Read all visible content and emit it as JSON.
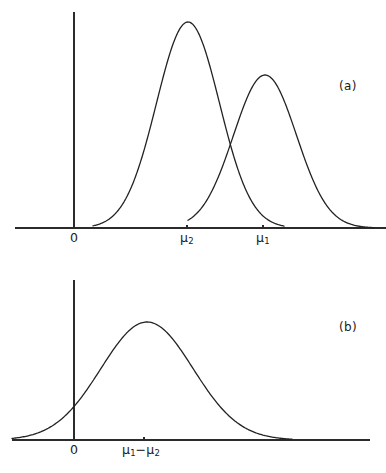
{
  "figure": {
    "background_color": "#ffffff",
    "curve_color": "#222222",
    "axis_color": "#2b2b2b",
    "panels": [
      {
        "id": "panel-a",
        "label": "(a)",
        "label_x": 339,
        "label_y": 80,
        "axis": {
          "x_axis": {
            "x_start": 15,
            "x_end": 386,
            "y": 228
          },
          "y_axis": {
            "x": 74,
            "y_start": 12,
            "y_end": 228
          }
        },
        "ticks": [
          {
            "name": "origin",
            "label": "0",
            "label_html": "0",
            "x": 74,
            "draw_tick": false,
            "label_x": 70,
            "label_y": 232
          },
          {
            "name": "mu2",
            "label": "μ2",
            "label_html": "μ<span class=\"sub\">2</span>",
            "x": 187,
            "draw_tick": true,
            "label_x": 180,
            "label_y": 232
          },
          {
            "name": "mu1",
            "label": "μ1",
            "label_html": "μ<span class=\"sub\">1</span>",
            "x": 263,
            "draw_tick": true,
            "label_x": 256,
            "label_y": 232
          }
        ]
      },
      {
        "id": "panel-b",
        "label": "(b)",
        "label_x": 339,
        "label_y": 321,
        "axis": {
          "x_axis": {
            "x_start": 12,
            "x_end": 370,
            "y": 440
          },
          "y_axis": {
            "x": 74,
            "y_start": 280,
            "y_end": 440
          }
        },
        "ticks": [
          {
            "name": "origin",
            "label": "0",
            "label_html": "0",
            "x": 74,
            "draw_tick": false,
            "label_x": 70,
            "label_y": 444
          },
          {
            "name": "mu1-minus-mu2",
            "label": "μ1−μ2",
            "label_html": "μ<span class=\"sub\">1</span>−μ<span class=\"sub\">2</span>",
            "x": 144,
            "draw_tick": true,
            "label_x": 122,
            "label_y": 444
          }
        ]
      }
    ]
  },
  "chart_data": {
    "type": "line",
    "title": "",
    "xlabel": "",
    "ylabel": "",
    "panels": [
      {
        "name": "(a)",
        "xlim": [
          15,
          386
        ],
        "ylim_px": [
          228,
          12
        ],
        "grid": false,
        "legend": "none",
        "series": [
          {
            "name": "distribution-mu2",
            "type": "gaussian",
            "mean_px": 188,
            "sigma_px": 31.5,
            "peak_y_px": 22,
            "baseline_y_px": 228,
            "x_from": 93,
            "x_to": 284
          },
          {
            "name": "distribution-mu1",
            "type": "gaussian",
            "mean_px": 265,
            "sigma_px": 31.5,
            "peak_y_px": 75,
            "baseline_y_px": 228,
            "x_from": 188,
            "x_to": 374
          }
        ]
      },
      {
        "name": "(b)",
        "xlim": [
          12,
          370
        ],
        "ylim_px": [
          440,
          280
        ],
        "grid": false,
        "legend": "none",
        "series": [
          {
            "name": "distribution-difference",
            "type": "gaussian",
            "mean_px": 147,
            "sigma_px": 46,
            "peak_y_px": 322,
            "baseline_y_px": 440,
            "x_from": 12,
            "x_to": 292
          }
        ]
      }
    ]
  }
}
